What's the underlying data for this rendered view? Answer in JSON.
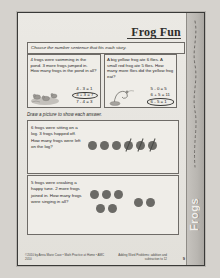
{
  "page": {
    "title": "Frog Fun",
    "side_tab_label": "Frogs",
    "instruction_1": "Choose the number sentence that fits each story.",
    "instruction_2": "Draw a picture to show each answer.",
    "page_number": "9"
  },
  "problems": [
    {
      "id": "problem-1",
      "story": "4 frogs were swimming in the pond. 3 more frogs jumped in. How many frogs in the pond in all?",
      "options": [
        "4 - 3 = 1",
        "4 + 3 = 7",
        "7 - 4 = 3"
      ],
      "circled_index": 1,
      "art": "frogs-in-pond-illustration"
    },
    {
      "id": "problem-2",
      "story": "A big yellow frog ate 6 flies. A small red frog ate 5 flies. How many more flies did the yellow frog eat?",
      "options": [
        "5 - 0 = 5",
        "6 + 5 = 11",
        "6 - 5 = 1"
      ],
      "circled_index": 2,
      "art": "frog-catching-fly-illustration"
    },
    {
      "id": "problem-3",
      "story": "6 frogs were sitting on a log. 3 frogs hopped off. How many frogs were left on the log?",
      "drawing": {
        "total_dots": 6,
        "crossed_out": 3
      }
    },
    {
      "id": "problem-4",
      "story": "5 frogs were croaking a happy tune. 2 more frogs joined in. How many frogs were singing in all?",
      "drawing": {
        "group_a": 5,
        "group_b": 2
      }
    }
  ],
  "footer": {
    "left": "©2010 by Anna Marie Case • Math Practice at Home • AMC 2010",
    "right": "Adding Word Problems: addition and subtraction to 12"
  },
  "colors": {
    "paper": "#e9e7e2",
    "ink": "#26261f",
    "dot": "#6b6a66",
    "tab": "#b9b6b1"
  }
}
